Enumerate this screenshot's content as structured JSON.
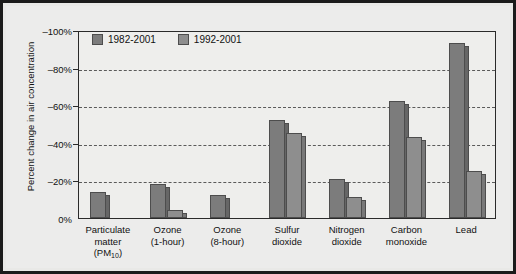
{
  "chart_data": {
    "type": "bar",
    "title": "",
    "xlabel": "",
    "ylabel": "Percent change in air concentration",
    "ylim": [
      0,
      -100
    ],
    "grid": true,
    "legend_position": "top-left-inside",
    "yticks": [
      "0%",
      "–20%",
      "–40%",
      "–60%",
      "–80%",
      "–100%"
    ],
    "ytick_values": [
      0,
      -20,
      -40,
      -60,
      -80,
      -100
    ],
    "categories": [
      "Particulate matter (PM10)",
      "Ozone (1-hour)",
      "Ozone (8-hour)",
      "Sulfur dioxide",
      "Nitrogen dioxide",
      "Carbon monoxide",
      "Lead"
    ],
    "category_lines": [
      [
        "Particulate",
        "matter",
        "(PM10)"
      ],
      [
        "Ozone",
        "(1-hour)"
      ],
      [
        "Ozone",
        "(8-hour)"
      ],
      [
        "Sulfur",
        "dioxide"
      ],
      [
        "Nitrogen",
        "dioxide"
      ],
      [
        "Carbon",
        "monoxide"
      ],
      [
        "Lead"
      ]
    ],
    "series": [
      {
        "name": "1982-2001",
        "color": "#7c7c7c",
        "values": [
          -14,
          -18,
          -12,
          -52,
          -21,
          -62,
          -93
        ]
      },
      {
        "name": "1992-2001",
        "color": "#8e8e8e",
        "values": [
          0,
          -4,
          0,
          -45,
          -11,
          -43,
          -25
        ]
      }
    ]
  },
  "legend": {
    "items": [
      {
        "label": "1982-2001",
        "color": "#7c7c7c"
      },
      {
        "label": "1992-2001",
        "color": "#8e8e8e"
      }
    ]
  },
  "colors": {
    "border": "#1b1b1b",
    "panel": "#ececeb",
    "plot": "#eeeeec",
    "gridline": "#5a5a5a",
    "bar_series_1": "#7c7c7c",
    "bar_series_2": "#8e8e8e",
    "bar_outline": "#4d4d4d",
    "text": "#111111"
  }
}
